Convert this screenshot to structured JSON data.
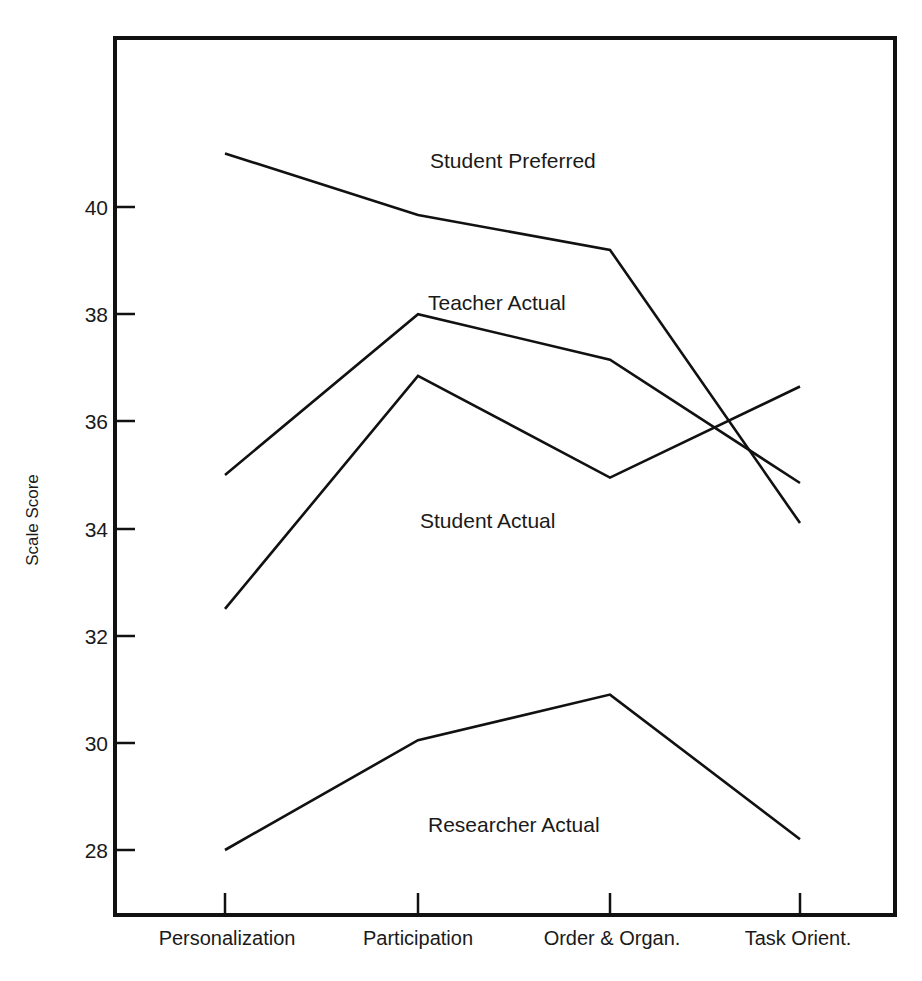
{
  "chart_data": {
    "type": "line",
    "title": "",
    "xlabel": "",
    "ylabel": "Scale Score",
    "categories": [
      "Personalization",
      "Participation",
      "Order & Organ.",
      "Task Orient."
    ],
    "yticks": [
      28,
      30,
      32,
      34,
      36,
      38,
      40
    ],
    "ylim": [
      26.8,
      41.6
    ],
    "grid": false,
    "legend_position": "inline-annotations",
    "series": [
      {
        "name": "Student Preferred",
        "values": [
          41.0,
          39.85,
          39.2,
          34.1
        ],
        "label_x": 430,
        "label_y": 168
      },
      {
        "name": "Teacher Actual",
        "values": [
          35.0,
          38.0,
          37.15,
          34.85
        ],
        "label_x": 428,
        "label_y": 310
      },
      {
        "name": "Student Actual",
        "values": [
          32.5,
          36.85,
          34.95,
          36.65
        ],
        "label_x": 420,
        "label_y": 528
      },
      {
        "name": "Researcher Actual",
        "values": [
          28.0,
          30.05,
          30.9,
          28.2
        ],
        "label_x": 428,
        "label_y": 832
      }
    ]
  },
  "axis": {
    "y_title": "Scale Score",
    "tick_labels": [
      "40",
      "38",
      "36",
      "34",
      "32",
      "30",
      "28"
    ],
    "category_labels": [
      "Personalization",
      "Participation",
      "Order & Organ.",
      "Task Orient."
    ]
  },
  "series_labels": {
    "s0": "Student Preferred",
    "s1": "Teacher Actual",
    "s2": "Student Actual",
    "s3": "Researcher Actual"
  },
  "colors": {
    "ink": "#111111",
    "background": "#ffffff"
  }
}
